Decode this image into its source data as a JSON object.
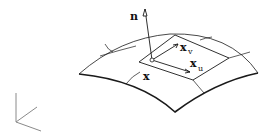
{
  "diagram": {
    "type": "surface-tangent-plane",
    "labels": {
      "normal": "n",
      "point": "x",
      "tangent_u": "x",
      "tangent_u_sub": "u",
      "tangent_v": "x",
      "tangent_v_sub": "v"
    },
    "colors": {
      "stroke": "#1a1a1a",
      "axes": "#888888",
      "background": "#ffffff"
    }
  }
}
